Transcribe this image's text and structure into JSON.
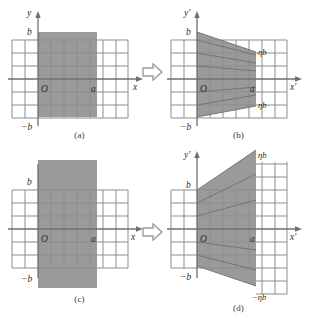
{
  "figure": {
    "type": "diagram",
    "panel_count": 4,
    "colors": {
      "shade_fill": "#9a9a9a",
      "grid_line": "#8d8d8d",
      "axis_line": "#6f6f6f",
      "text": "#2e2e2e",
      "background": "#ffffff",
      "arrow_stroke": "#9a9a9a"
    },
    "transform_arrow": "rightwards-hollow-arrow"
  },
  "panels": [
    {
      "id": "a",
      "caption": "(a)",
      "role": "source-compression",
      "axes": {
        "x_label": "x",
        "y_label": "y",
        "origin_label": "O"
      },
      "tick_labels": {
        "y_top": "b",
        "y_bottom": "−b",
        "x_right": "a"
      },
      "grid": {
        "cols_left": 2,
        "cols_right": 3,
        "rows_above": 3,
        "rows_below": 3
      },
      "region": {
        "shape": "rectangle",
        "top": "b",
        "bottom": "−b",
        "left": "0",
        "right": "a"
      }
    },
    {
      "id": "b",
      "caption": "(b)",
      "role": "result-compression",
      "axes": {
        "x_label": "x'",
        "y_label": "y'",
        "origin_label": "O"
      },
      "tick_labels": {
        "y_top": "b",
        "y_bottom": "−b",
        "x_right": "a",
        "right_top": "ηb",
        "right_bottom": "ηb"
      },
      "grid": {
        "cols_left": 2,
        "cols_right": 3,
        "rows_above": 3,
        "rows_below": 3
      },
      "region": {
        "shape": "trapezoid",
        "left_top": "b",
        "left_bottom": "−b",
        "right_top": "ηb",
        "right_bottom": "−ηb",
        "note": "transverse extent shrinks from b to ηb across x = 0 to a"
      }
    },
    {
      "id": "c",
      "caption": "(c)",
      "role": "source-expansion",
      "axes": {
        "x_label": "x",
        "y_label": "y",
        "origin_label": "O"
      },
      "tick_labels": {
        "y_top": "b",
        "y_bottom": "−b",
        "x_right": "a"
      },
      "grid": {
        "cols_left": 2,
        "cols_right": 3,
        "rows_above": 3,
        "rows_below": 3
      },
      "region": {
        "shape": "rectangle-tall",
        "top": "above b",
        "bottom": "below −b",
        "left": "0",
        "right": "a"
      }
    },
    {
      "id": "d",
      "caption": "(d)",
      "role": "result-expansion",
      "axes": {
        "x_label": "x'",
        "y_label": "y'",
        "origin_label": "O"
      },
      "tick_labels": {
        "y_top": "b",
        "y_bottom": "−b",
        "x_right": "a",
        "right_top": "ηb",
        "right_bottom": "−ηb"
      },
      "grid": {
        "cols_left": 2,
        "cols_right": 3,
        "rows_above": 3,
        "rows_below": 3
      },
      "region": {
        "shape": "trapezoid-flared",
        "left_top": "b",
        "left_bottom": "−b",
        "right_top": "ηb",
        "right_bottom": "−ηb",
        "note": "transverse extent grows from b to ηb across x = 0 to a"
      }
    }
  ],
  "symbols": {
    "eta": "η",
    "a": "a",
    "b": "b",
    "minus_b": "−b",
    "eta_b": "ηb",
    "minus_eta_b": "−ηb",
    "origin": "O",
    "x": "x",
    "y": "y",
    "x_prime": "x'",
    "y_prime": "y'"
  }
}
